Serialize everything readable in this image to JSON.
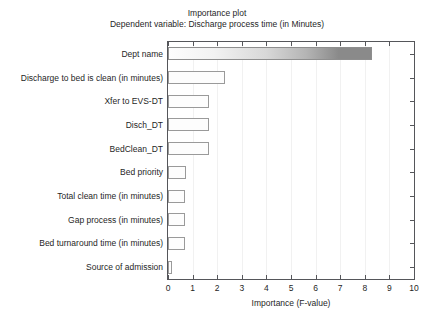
{
  "chart_data": {
    "type": "bar",
    "orientation": "horizontal",
    "title": "Importance plot",
    "subtitle": "Dependent variable: Discharge process time (in Minutes)",
    "xlabel": "Importance (F-value)",
    "ylabel": "",
    "xlim": [
      0,
      10
    ],
    "xticks": [
      "0",
      "1",
      "2",
      "3",
      "4",
      "5",
      "6",
      "7",
      "8",
      "9",
      "10"
    ],
    "grid": false,
    "legend": "none",
    "categories": [
      "Dept name",
      "Discharge to bed is clean (in minutes)",
      "Xfer to EVS-DT",
      "Disch_DT",
      "BedClean_DT",
      "Bed priority",
      "Total clean time (in minutes)",
      "Gap process (in minutes)",
      "Bed turnaround time (in minutes)",
      "Source of admission"
    ],
    "values": [
      8.3,
      2.3,
      1.65,
      1.65,
      1.65,
      0.72,
      0.7,
      0.7,
      0.7,
      0.15
    ],
    "bar_fill_light": "#fdfdfd",
    "bar_fill_dark": "#8a8a8a",
    "bar_edge_color": "#9a9a9a",
    "axis_color": "#55565a",
    "background": "#ffffff"
  }
}
